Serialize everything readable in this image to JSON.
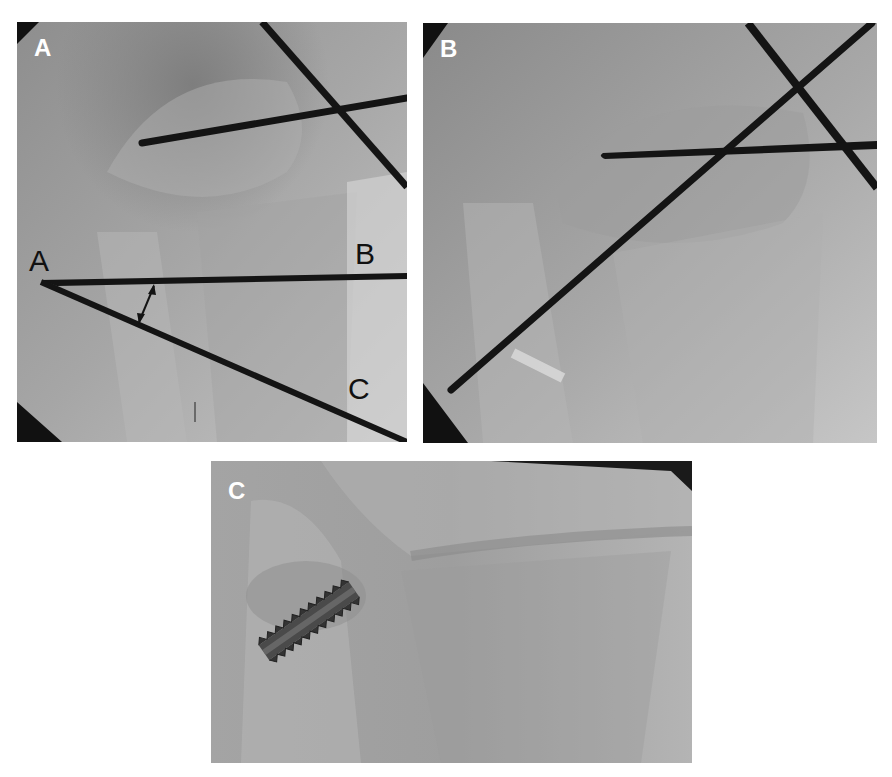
{
  "figure": {
    "panels": [
      {
        "id": "A",
        "label": "A",
        "description": "Fluoroscopic AP view of ankle with two K-wires and angle measurement lines",
        "annotations": {
          "vertex": "A",
          "ray_upper": "B",
          "ray_lower": "C"
        },
        "angle_marker": "double-headed arrow between lines AB and AC"
      },
      {
        "id": "B",
        "label": "B",
        "description": "Fluoroscopic view with three crossing K-wires"
      },
      {
        "id": "C",
        "label": "C",
        "description": "Radiograph with a cannulated screw fixation in the distal fibula region"
      }
    ],
    "colors": {
      "background": "#ffffff",
      "xray_mid": "#9a9a9a",
      "xray_light": "#c8c8c8",
      "wire": "#141414",
      "label_text": "#ffffff",
      "annotation_text": "#111111"
    }
  }
}
